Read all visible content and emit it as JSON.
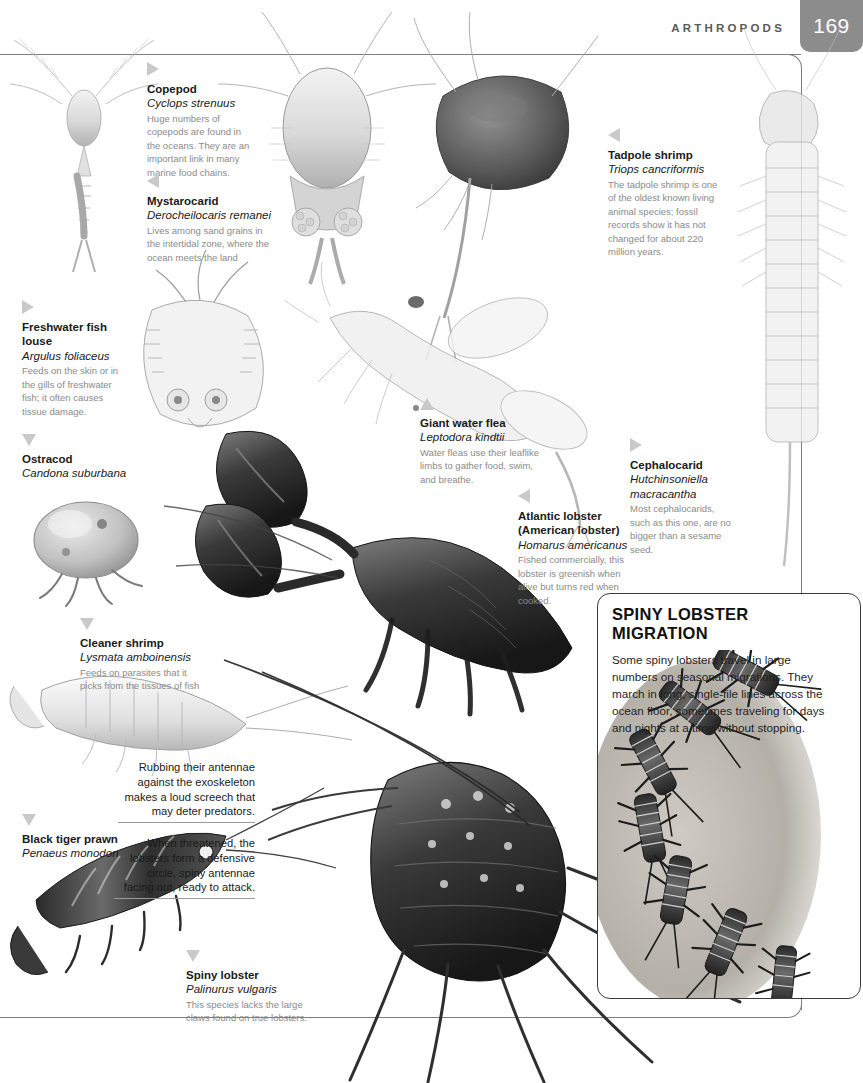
{
  "header": {
    "running_head": "ARTHROPODS",
    "page_number": "169"
  },
  "callouts": [
    {
      "id": "copepod",
      "marker": "right",
      "common": "Copepod",
      "scientific": "Cyclops strenuus",
      "description": "Huge numbers of copepods are found in the oceans. They are an important link in many marine food chains."
    },
    {
      "id": "mystarocarid",
      "marker": "left",
      "common": "Mystarocarid",
      "scientific": "Derocheilocaris remanei",
      "description": "Lives among sand grains in the intertidal zone, where the ocean meets the land"
    },
    {
      "id": "tadpole-shrimp",
      "marker": "left",
      "common": "Tadpole shrimp",
      "scientific": "Triops cancriformis",
      "description": "The tadpole shrimp is one of the oldest known living animal species; fossil records show it has not changed for about 220 million years."
    },
    {
      "id": "freshwater-fish-louse",
      "marker": "right",
      "common": "Freshwater fish louse",
      "scientific": "Argulus foliaceus",
      "description": "Feeds on the skin or in the gills of freshwater fish; it often causes tissue damage."
    },
    {
      "id": "ostracod",
      "marker": "down",
      "common": "Ostracod",
      "scientific": "Candona suburbana",
      "description": ""
    },
    {
      "id": "giant-water-flea",
      "marker": "up",
      "common": "Giant water flea",
      "scientific": "Leptodora kindtii",
      "description": "Water fleas use their leaflike limbs to gather food, swim, and breathe."
    },
    {
      "id": "cephalocarid",
      "marker": "right",
      "common": "Cephalocarid",
      "scientific": "Hutchinsoniella macracantha",
      "description": "Most cephalocarids, such as this one, are no bigger than a sesame seed."
    },
    {
      "id": "atlantic-lobster",
      "marker": "left",
      "common": "Atlantic lobster (American lobster)",
      "scientific": "Homarus americanus",
      "description": "Fished commercially, this lobster is greenish when alive but turns red when cooked."
    },
    {
      "id": "cleaner-shrimp",
      "marker": "down",
      "common": "Cleaner shrimp",
      "scientific": "Lysmata amboinensis",
      "description": "Feeds on parasites that it picks from the tissues of fish"
    },
    {
      "id": "black-tiger-prawn",
      "marker": "down",
      "common": "Black tiger prawn",
      "scientific": "Penaeus monodon",
      "description": ""
    },
    {
      "id": "spiny-lobster",
      "marker": "down",
      "common": "Spiny lobster",
      "scientific": "Palinurus vulgaris",
      "description": "This species lacks the large claws found on true lobsters."
    }
  ],
  "migration": {
    "title": "SPINY LOBSTER MIGRATION",
    "body": "Some spiny lobsters travel in large numbers on seasonal migrations. They march in long, single-file lines across the ocean floor, sometimes traveling for days and nights at a time without stopping.",
    "caption_1": "Rubbing their antennae against the exoskeleton makes a loud screech that may deter predators.",
    "caption_2": "When threatened, the lobsters form a defensive circle, spiny antennae facing out, ready to attack."
  },
  "colors": {
    "page_number_box": "#8c8c8c",
    "rule": "#7d7d7d",
    "marker_triangle": "#c9c9c9",
    "description_text": "#8a8a8a",
    "heading_text": "#1a1a1a"
  }
}
